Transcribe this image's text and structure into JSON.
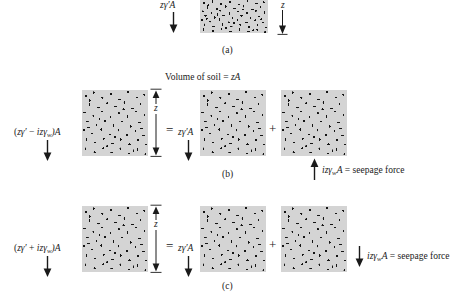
{
  "figure": {
    "title_note": "Volume of soil = zA",
    "panels": [
      {
        "id": "a",
        "caption": "(a)",
        "left_force_label": "zγ′A",
        "depth_label": "z",
        "blocks": 1
      },
      {
        "id": "b",
        "caption": "(b)",
        "left_force_label_parts": {
          "open": "(",
          "term1": "zγ′",
          "operator": "−",
          "term2": "izγ",
          "term2_sub": "w",
          "close": ")A"
        },
        "left_force_label": "(zγ′ − izγwA)A",
        "depth_label": "z",
        "equals_sign": "=",
        "middle_force_label": "zγ′A",
        "plus_sign": "+",
        "seepage_label_parts": {
          "term": "izγ",
          "term_sub": "w",
          "suffix": "A",
          "equals": "=",
          "text": "seepage force"
        },
        "seepage_label": "izγwA = seepage force",
        "seepage_direction": "up",
        "blocks": 3
      },
      {
        "id": "c",
        "caption": "(c)",
        "left_force_label_parts": {
          "open": "(",
          "term1": "zγ′",
          "operator": "+",
          "term2": "izγ",
          "term2_sub": "w",
          "close": ")A"
        },
        "left_force_label": "(zγ′ + izγwA)A",
        "depth_label": "z",
        "equals_sign": "=",
        "middle_force_label": "zγ′A",
        "plus_sign": "+",
        "seepage_label_parts": {
          "term": "izγ",
          "term_sub": "w",
          "suffix": "A",
          "equals": "=",
          "text": "seepage force"
        },
        "seepage_label": "izγwA = seepage force",
        "seepage_direction": "down",
        "blocks": 3
      }
    ],
    "colors": {
      "soil_fill": "#d4d4d4",
      "soil_grain": "#141414",
      "ink": "#1a1a1a",
      "page": "#ffffff"
    }
  }
}
